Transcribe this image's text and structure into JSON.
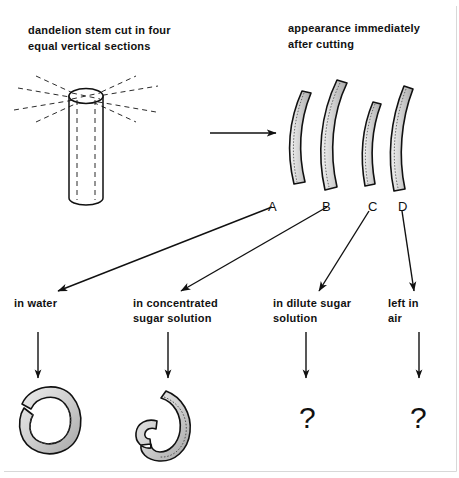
{
  "diagram": {
    "title_left": "dandelion stem cut in four equal vertical sections",
    "title_right": "appearance immediately after cutting",
    "headers": {
      "left_line1": "dandelion stem cut in four",
      "left_line2": "equal vertical sections",
      "right_line1": "appearance immediately",
      "right_line2": "after cutting"
    },
    "strip_labels": [
      {
        "id": "A",
        "label": "A"
      },
      {
        "id": "B",
        "label": "B"
      },
      {
        "id": "C",
        "label": "C"
      },
      {
        "id": "D",
        "label": "D"
      }
    ],
    "treatments": [
      {
        "id": "A",
        "line1": "in water",
        "line2": "",
        "result": "curled-outward-spiral"
      },
      {
        "id": "B",
        "line1": "in concentrated",
        "line2": "sugar solution",
        "result": "curled-inward-spiral"
      },
      {
        "id": "C",
        "line1": "in dilute sugar",
        "line2": "solution",
        "result": "?"
      },
      {
        "id": "D",
        "line1": "left in",
        "line2": "air",
        "result": "?"
      }
    ],
    "unknown_marker": "?",
    "colors": {
      "ink": "#111111",
      "fill_light": "#d9d9d9",
      "fill_mid": "#bdbdbd",
      "paper": "#ffffff",
      "dash": "#2b2b2b"
    },
    "icon_names": {
      "transform_arrow": "right-arrow-icon",
      "cut_guides": "dashed-cut-lines-icon",
      "stem": "cylinder-stem-icon"
    }
  }
}
